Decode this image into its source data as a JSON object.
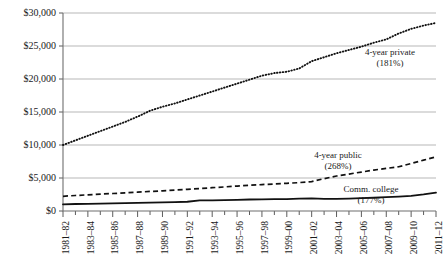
{
  "chart_data": {
    "type": "line",
    "title": "",
    "subtitle": "",
    "xlabel": "",
    "ylabel": "",
    "ylim": [
      0,
      30000
    ],
    "ytick_labels": [
      "$30,000",
      "$25,000",
      "$20,000",
      "$15,000",
      "$10,000",
      "$5,000",
      "$0"
    ],
    "ytick_values": [
      30000,
      25000,
      20000,
      15000,
      10000,
      5000,
      0
    ],
    "grid": "horizontal",
    "legend_position": "inline-annotations",
    "x": [
      "1981-82",
      "1982-83",
      "1983-84",
      "1984-85",
      "1985-86",
      "1986-87",
      "1987-88",
      "1988-89",
      "1989-90",
      "1990-91",
      "1991-92",
      "1992-93",
      "1993-94",
      "1994-95",
      "1995-96",
      "1996-97",
      "1997-98",
      "1998-99",
      "1999-00",
      "2000-01",
      "2001-02",
      "2002-03",
      "2003-04",
      "2004-05",
      "2005-06",
      "2006-07",
      "2007-08",
      "2008-09",
      "2009-10",
      "2010-11",
      "2011-12"
    ],
    "xtick_labels": [
      "1981–82",
      "1983–84",
      "1985–86",
      "1987–88",
      "1989–90",
      "1991–92",
      "1993–94",
      "1995–96",
      "1997–98",
      "1999–00",
      "2001–02",
      "2003–04",
      "2005–06",
      "2007–08",
      "2009–10",
      "2011–12"
    ],
    "series": [
      {
        "name": "4-year private",
        "style": "dotted",
        "growth_label": "(181%)",
        "values": [
          10000,
          10700,
          11400,
          12100,
          12800,
          13500,
          14300,
          15200,
          15800,
          16300,
          16900,
          17500,
          18100,
          18700,
          19300,
          19900,
          20500,
          20900,
          21100,
          21600,
          22700,
          23300,
          23900,
          24400,
          24900,
          25500,
          26000,
          26900,
          27600,
          28100,
          28500
        ]
      },
      {
        "name": "4-year public",
        "style": "dashed",
        "growth_label": "(268%)",
        "values": [
          2230,
          2350,
          2450,
          2560,
          2650,
          2750,
          2850,
          2960,
          3050,
          3160,
          3280,
          3400,
          3530,
          3650,
          3780,
          3900,
          4000,
          4100,
          4200,
          4300,
          4450,
          4900,
          5300,
          5600,
          5900,
          6200,
          6450,
          6700,
          7200,
          7700,
          8200
        ]
      },
      {
        "name": "Comm. college",
        "style": "solid",
        "growth_label": "(177%)",
        "values": [
          1010,
          1060,
          1090,
          1120,
          1150,
          1180,
          1220,
          1260,
          1300,
          1340,
          1400,
          1620,
          1610,
          1650,
          1700,
          1740,
          1770,
          1800,
          1810,
          1870,
          1900,
          1850,
          1840,
          1880,
          1940,
          2010,
          2090,
          2180,
          2300,
          2520,
          2790
        ]
      }
    ],
    "annotations": [
      {
        "name": "4-year private",
        "line1": "4-year private",
        "line2": "(181%)"
      },
      {
        "name": "4-year public",
        "line1": "4-year public",
        "line2": "(268%)"
      },
      {
        "name": "Comm. college",
        "line1": "Comm. college",
        "line2": "(177%)"
      }
    ]
  },
  "colors": {
    "background": "#ffffff",
    "ink": "#111111",
    "gridline": "#9a9a9a",
    "axis": "#6e6e6e"
  }
}
